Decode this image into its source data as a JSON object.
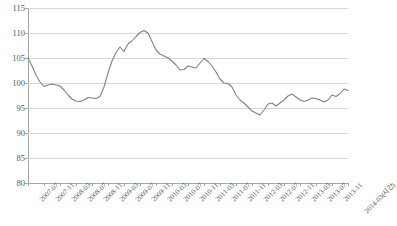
{
  "chart_data": {
    "type": "line",
    "title": "",
    "subtitle": "",
    "xlabel": "(시간)",
    "ylabel": "",
    "ylim": [
      80,
      115
    ],
    "ytick_step": 5,
    "yticks": [
      80,
      85,
      90,
      95,
      100,
      105,
      110,
      115
    ],
    "ytick_labels": [
      "80",
      "85",
      "90",
      "95",
      "100",
      "105",
      "110",
      "115"
    ],
    "grid": true,
    "grid_axis": "y",
    "legend": false,
    "legend_position": "none",
    "line_color": "#808080",
    "xtick_labels": [
      "2007-07",
      "2007-11",
      "2008-03",
      "2008-07",
      "2008-11",
      "2009-03",
      "2009-07",
      "2009-11",
      "2010-03",
      "2010-07",
      "2010-11",
      "2011-03",
      "2011-07",
      "2011-11",
      "2012-03",
      "2012-07",
      "2012-11",
      "2013-03",
      "2013-07",
      "2013-11",
      "2014-03(시간)"
    ],
    "x": [
      "2007-07",
      "2007-08",
      "2007-09",
      "2007-10",
      "2007-11",
      "2007-12",
      "2008-01",
      "2008-02",
      "2008-03",
      "2008-04",
      "2008-05",
      "2008-06",
      "2008-07",
      "2008-08",
      "2008-09",
      "2008-10",
      "2008-11",
      "2008-12",
      "2009-01",
      "2009-02",
      "2009-03",
      "2009-04",
      "2009-05",
      "2009-06",
      "2009-07",
      "2009-08",
      "2009-09",
      "2009-10",
      "2009-11",
      "2009-12",
      "2010-01",
      "2010-02",
      "2010-03",
      "2010-04",
      "2010-05",
      "2010-06",
      "2010-07",
      "2010-08",
      "2010-09",
      "2010-10",
      "2010-11",
      "2010-12",
      "2011-01",
      "2011-02",
      "2011-03",
      "2011-04",
      "2011-05",
      "2011-06",
      "2011-07",
      "2011-08",
      "2011-09",
      "2011-10",
      "2011-11",
      "2011-12",
      "2012-01",
      "2012-02",
      "2012-03",
      "2012-04",
      "2012-05",
      "2012-06",
      "2012-07",
      "2012-08",
      "2012-09",
      "2012-10",
      "2012-11",
      "2012-12",
      "2013-01",
      "2013-02",
      "2013-03",
      "2013-04",
      "2013-05",
      "2013-06",
      "2013-07",
      "2013-08",
      "2013-09",
      "2013-10",
      "2013-11",
      "2013-12",
      "2014-01",
      "2014-02",
      "2014-03"
    ],
    "values": [
      105.0,
      103.4,
      101.6,
      100.2,
      99.3,
      99.6,
      99.8,
      99.6,
      99.4,
      98.6,
      97.6,
      96.8,
      96.4,
      96.3,
      96.6,
      97.1,
      97.0,
      96.9,
      97.3,
      99.2,
      102.0,
      104.4,
      106.1,
      107.2,
      106.3,
      107.8,
      108.4,
      109.3,
      110.1,
      110.5,
      110.0,
      108.3,
      106.6,
      105.8,
      105.4,
      105.0,
      104.4,
      103.6,
      102.6,
      102.7,
      103.4,
      103.2,
      103.0,
      104.0,
      104.9,
      104.3,
      103.4,
      102.2,
      100.8,
      100.0,
      99.9,
      99.2,
      97.6,
      96.6,
      96.0,
      95.2,
      94.4,
      94.0,
      93.6,
      94.6,
      95.8,
      96.0,
      95.4,
      96.0,
      96.6,
      97.4,
      97.8,
      97.2,
      96.6,
      96.3,
      96.6,
      97.0,
      96.9,
      96.6,
      96.2,
      96.6,
      97.6,
      97.3,
      97.9,
      98.8,
      98.5
    ]
  }
}
